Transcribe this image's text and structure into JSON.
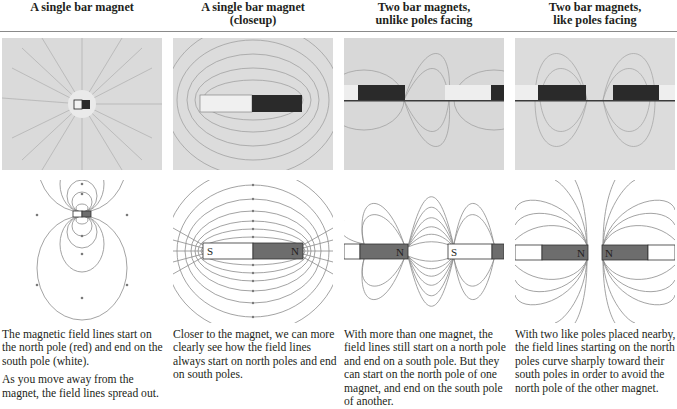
{
  "columns": [
    {
      "title_line1": "A single bar magnet",
      "title_line2": "",
      "caption": [
        "The magnetic field lines start on the north pole (red) and end on the south pole (white).",
        "As you move away from the magnet, the field lines spread out."
      ],
      "diagram_labels": {}
    },
    {
      "title_line1": "A single bar magnet",
      "title_line2": "(closeup)",
      "caption": [
        "Closer to the magnet, we can more clearly see how the field lines always start on north poles and end on south poles."
      ],
      "diagram_labels": {
        "south": "S",
        "north": "N"
      }
    },
    {
      "title_line1": "Two bar magnets,",
      "title_line2": "unlike poles facing",
      "caption": [
        "With more than one magnet, the field lines still start on a north pole and end on a south pole. But they can start on the north pole of one magnet, and end on the south pole of another."
      ],
      "diagram_labels": {
        "north": "N",
        "south": "S"
      }
    },
    {
      "title_line1": "Two bar magnets,",
      "title_line2": "like poles facing",
      "caption": [
        "With two like poles placed nearby, the field lines starting on the north poles curve sharply toward their south poles in order to avoid the north pole of the other magnet."
      ],
      "diagram_labels": {
        "north_left": "N",
        "north_right": "N"
      }
    }
  ],
  "colors": {
    "north_pole": "#6d6d6d",
    "south_pole": "#ffffff",
    "field_line": "#8c8c8c",
    "filings_background": "#d9d9d9",
    "rule": "#8a8a8a"
  }
}
